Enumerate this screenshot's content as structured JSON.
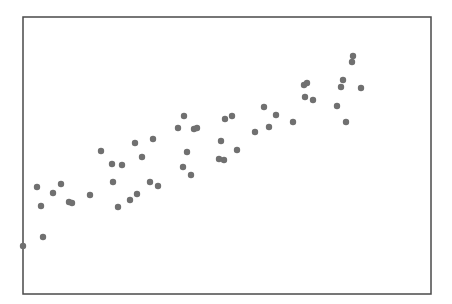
{
  "chart_data": {
    "type": "scatter",
    "title": "",
    "xlabel": "",
    "ylabel": "",
    "xlim": [
      0,
      408
    ],
    "ylim": [
      0,
      277
    ],
    "grid": false,
    "legend": null,
    "marker_color": "#707070",
    "frame_color": "#4a4a4a",
    "series": [
      {
        "name": "points",
        "x": [
          0,
          14,
          18,
          20,
          30,
          38,
          46,
          49,
          67,
          78,
          89,
          99,
          90,
          95,
          107,
          114,
          112,
          119,
          127,
          135,
          130,
          155,
          161,
          171,
          174,
          164,
          160,
          168,
          196,
          201,
          198,
          202,
          209,
          214,
          232,
          241,
          246,
          253,
          270,
          281,
          284,
          282,
          290,
          314,
          323,
          318,
          320,
          330,
          329,
          338
        ],
        "y": [
          48,
          107,
          88,
          57,
          101,
          110,
          92,
          91,
          99,
          143,
          130,
          129,
          112,
          87,
          94,
          100,
          151,
          137,
          112,
          108,
          155,
          166,
          178,
          165,
          166,
          142,
          127,
          119,
          135,
          134,
          153,
          175,
          178,
          144,
          162,
          187,
          167,
          179,
          172,
          209,
          211,
          197,
          194,
          188,
          172,
          207,
          214,
          238,
          232,
          206
        ]
      }
    ]
  }
}
